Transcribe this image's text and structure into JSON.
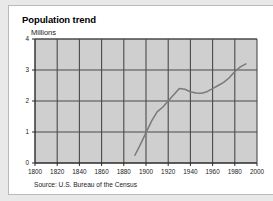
{
  "card": {
    "title": "Population trend",
    "source": "Source: U.S. Bureau of the Census"
  },
  "colors": {
    "page_background": "#e9e9e9",
    "card_background": "#ffffff",
    "plot_background": "#cfcfcf",
    "gridline": "#4a4a4a",
    "axis": "#2b2b2b",
    "series_line": "#7a7a7a",
    "text": "#1a1a1a"
  },
  "chart_data": {
    "type": "line",
    "title": "Population trend",
    "subtitle": "Millions",
    "xlabel": "",
    "ylabel": "Millions",
    "xlim": [
      1800,
      2000
    ],
    "ylim": [
      0,
      4
    ],
    "xticks": [
      1800,
      1820,
      1840,
      1860,
      1880,
      1900,
      1920,
      1940,
      1960,
      1980,
      2000
    ],
    "xtick_labels": [
      "1800",
      "1820",
      "1840",
      "1860",
      "1880",
      "1900",
      "1920",
      "1940",
      "1960",
      "1980",
      "2000"
    ],
    "yticks": [
      0,
      1,
      2,
      3,
      4
    ],
    "ytick_labels": [
      "0",
      "1",
      "2",
      "3",
      "4"
    ],
    "grid": true,
    "legend": false,
    "legend_position": "none",
    "annotation": "Source: U.S. Bureau of the Census",
    "series": [
      {
        "name": "Population",
        "x": [
          1890,
          1895,
          1900,
          1905,
          1910,
          1915,
          1920,
          1925,
          1930,
          1935,
          1940,
          1945,
          1950,
          1955,
          1960,
          1965,
          1970,
          1975,
          1980,
          1985,
          1990
        ],
        "values": [
          0.25,
          0.6,
          0.98,
          1.35,
          1.65,
          1.8,
          2.0,
          2.2,
          2.4,
          2.38,
          2.3,
          2.26,
          2.25,
          2.3,
          2.4,
          2.5,
          2.6,
          2.75,
          2.95,
          3.1,
          3.2
        ]
      }
    ]
  }
}
